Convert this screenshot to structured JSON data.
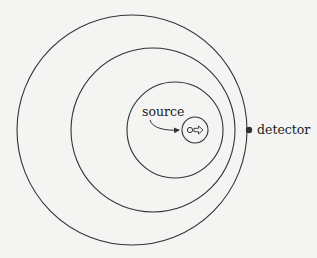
{
  "diagram": {
    "labels": {
      "source": "source",
      "detector": "detector"
    },
    "wavefronts": [
      {
        "cx": 132,
        "cy": 130,
        "r": 115
      },
      {
        "cx": 153,
        "cy": 130,
        "r": 82
      },
      {
        "cx": 175,
        "cy": 130,
        "r": 48
      },
      {
        "cx": 195,
        "cy": 130,
        "r": 13
      }
    ],
    "source_position": {
      "x": 190,
      "y": 130
    },
    "motion_direction": "right",
    "detector_position": {
      "x": 249,
      "y": 130
    },
    "colors": {
      "stroke": "#333333",
      "background": "#f4f4f2",
      "text": "#222222"
    }
  }
}
